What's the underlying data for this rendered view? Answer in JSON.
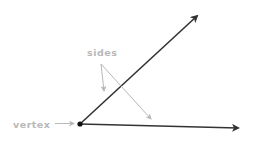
{
  "diagram": {
    "labels": {
      "sides": "sides",
      "vertex": "vertex"
    },
    "colors": {
      "ray": "#333333",
      "annotation": "#b8b8b8",
      "background": "#ffffff"
    },
    "vertex": {
      "x": 80,
      "y": 124
    },
    "rays": [
      {
        "name": "upper-ray",
        "from": [
          80,
          124
        ],
        "to": [
          199,
          14
        ]
      },
      {
        "name": "lower-ray",
        "from": [
          80,
          124
        ],
        "to": [
          241,
          128
        ]
      }
    ],
    "pointers": [
      {
        "name": "sides-pointer-left",
        "from": [
          101,
          64
        ],
        "to": [
          104,
          92
        ]
      },
      {
        "name": "sides-pointer-right",
        "from": [
          101,
          64
        ],
        "to": [
          152,
          120
        ]
      },
      {
        "name": "vertex-pointer",
        "from": [
          55,
          123
        ],
        "to": [
          75,
          123
        ]
      }
    ]
  }
}
